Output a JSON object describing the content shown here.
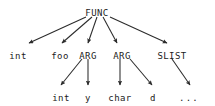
{
  "diagram": {
    "type": "parse-tree",
    "background_color": "#ffffff",
    "line_color": "#2b2b2b",
    "text_color": "#1b1b1b",
    "nodes": {
      "root": {
        "label": "FUNC",
        "x": 97,
        "y": 8
      },
      "level2": [
        {
          "id": "int-type",
          "label": "int",
          "x": 18,
          "y": 51
        },
        {
          "id": "foo-name",
          "label": "foo",
          "x": 60,
          "y": 51
        },
        {
          "id": "arg-1",
          "label": "ARG",
          "x": 88,
          "y": 51
        },
        {
          "id": "arg-2",
          "label": "ARG",
          "x": 122,
          "y": 51
        },
        {
          "id": "slist",
          "label": "SLIST",
          "x": 172,
          "y": 51
        }
      ],
      "level3": [
        {
          "id": "arg1-type",
          "label": "int",
          "x": 61,
          "y": 93
        },
        {
          "id": "arg1-name",
          "label": "y",
          "x": 88,
          "y": 93
        },
        {
          "id": "arg2-type",
          "label": "char",
          "x": 120,
          "y": 93
        },
        {
          "id": "arg2-name",
          "label": "d",
          "x": 153,
          "y": 93
        },
        {
          "id": "slist-more",
          "label": "...",
          "x": 189,
          "y": 93
        }
      ]
    },
    "edges": [
      {
        "id": "func-to-int",
        "from": "FUNC",
        "to": "int",
        "x1": 86,
        "y1": 17,
        "x2": 29,
        "y2": 43
      },
      {
        "id": "func-to-foo",
        "from": "FUNC",
        "to": "foo",
        "x1": 92,
        "y1": 17,
        "x2": 62,
        "y2": 43
      },
      {
        "id": "func-to-arg1",
        "from": "FUNC",
        "to": "ARG",
        "x1": 97,
        "y1": 17,
        "x2": 88,
        "y2": 43
      },
      {
        "id": "func-to-arg2",
        "from": "FUNC",
        "to": "ARG",
        "x1": 103,
        "y1": 17,
        "x2": 117,
        "y2": 43
      },
      {
        "id": "func-to-slist",
        "from": "FUNC",
        "to": "SLIST",
        "x1": 110,
        "y1": 17,
        "x2": 167,
        "y2": 43
      },
      {
        "id": "arg1-to-int",
        "from": "ARG",
        "to": "int",
        "x1": 82,
        "y1": 59,
        "x2": 61,
        "y2": 85
      },
      {
        "id": "arg1-to-y",
        "from": "ARG",
        "to": "y",
        "x1": 88,
        "y1": 59,
        "x2": 88,
        "y2": 85
      },
      {
        "id": "arg2-to-char",
        "from": "ARG",
        "to": "char",
        "x1": 120,
        "y1": 59,
        "x2": 120,
        "y2": 85
      },
      {
        "id": "arg2-to-d",
        "from": "ARG",
        "to": "d",
        "x1": 130,
        "y1": 59,
        "x2": 152,
        "y2": 85
      },
      {
        "id": "slist-to-dots",
        "from": "SLIST",
        "to": "...",
        "x1": 172,
        "y1": 59,
        "x2": 190,
        "y2": 85
      }
    ]
  }
}
